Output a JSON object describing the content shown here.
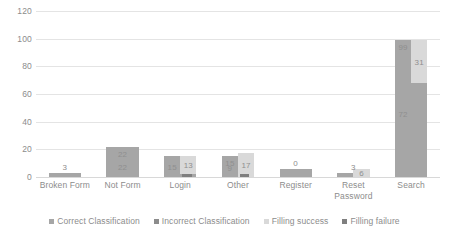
{
  "chart_data": {
    "type": "bar",
    "title": "",
    "subtitle": "",
    "xlabel": "",
    "ylabel": "",
    "ylim": [
      0,
      120
    ],
    "ytick_values": [
      120,
      100,
      80,
      60,
      40,
      20,
      0
    ],
    "ytick_labels": [
      "120",
      "100",
      "80",
      "60",
      "40",
      "20",
      "0"
    ],
    "grid": true,
    "legend_position": "bottom",
    "categories": [
      "Broken Form",
      "Not Form",
      "Login",
      "Other",
      "Register",
      "Reset Password",
      "Search"
    ],
    "series": [
      {
        "name": "Correct Classification",
        "color": "#a6a6a6",
        "values": [
          3,
          22,
          15,
          15,
          6,
          3,
          99
        ]
      },
      {
        "name": "Incorrect Classification",
        "color": "#8c8c8c",
        "values": [
          0,
          0,
          0,
          0,
          0,
          0,
          0
        ]
      },
      {
        "name": "Filling success",
        "color": "#d9d9d9",
        "values": [
          0,
          0,
          13,
          17,
          0,
          6,
          31
        ]
      },
      {
        "name": "Filling failure",
        "color": "#7f7f7f",
        "values": [
          0,
          0,
          2,
          2,
          0,
          0,
          0
        ]
      }
    ],
    "data_labels": [
      {
        "category": "Broken Form",
        "text": "3",
        "series": "Correct Classification",
        "placement": "above"
      },
      {
        "category": "Not Form",
        "text": "22",
        "series": "Correct Classification",
        "placement": "inside"
      },
      {
        "category": "Not Form",
        "text": "22",
        "series": "Incorrect Classification",
        "placement": "inside"
      },
      {
        "category": "Login",
        "text": "15",
        "series": "Correct Classification",
        "placement": "inside"
      },
      {
        "category": "Login",
        "text": "13",
        "series": "Filling success",
        "placement": "inside"
      },
      {
        "category": "Other",
        "text": "15",
        "series": "Correct Classification",
        "placement": "inside"
      },
      {
        "category": "Other",
        "text": "9",
        "series": "Correct Classification",
        "placement": "inside"
      },
      {
        "category": "Other",
        "text": "17",
        "series": "Filling success",
        "placement": "inside"
      },
      {
        "category": "Register",
        "text": "0",
        "series": "Correct Classification",
        "placement": "above"
      },
      {
        "category": "Reset Password",
        "text": "3",
        "series": "Correct Classification",
        "placement": "above"
      },
      {
        "category": "Reset Password",
        "text": "6",
        "series": "Filling success",
        "placement": "inside"
      },
      {
        "category": "Search",
        "text": "99",
        "series": "Correct Classification",
        "placement": "inside"
      },
      {
        "category": "Search",
        "text": "72",
        "series": "Correct Classification",
        "placement": "inside"
      },
      {
        "category": "Search",
        "text": "31",
        "series": "Filling success",
        "placement": "inside"
      }
    ]
  }
}
